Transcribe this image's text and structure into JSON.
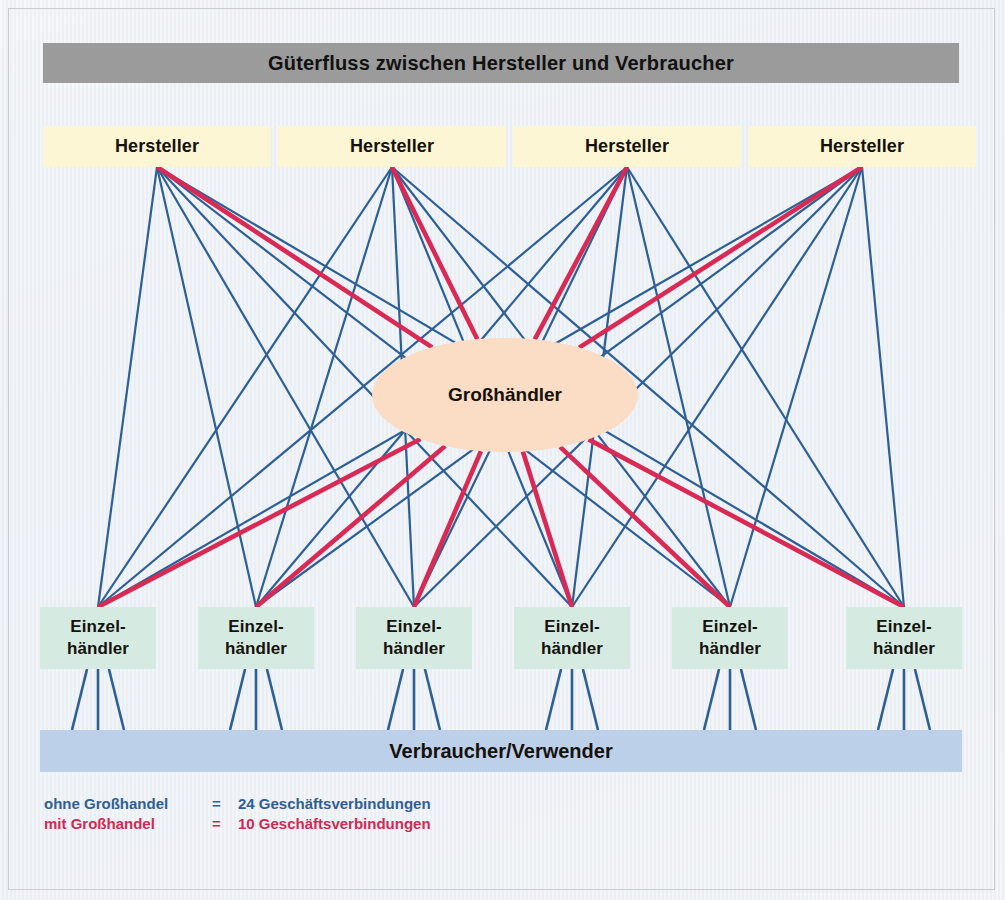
{
  "title": "Güterfluss zwischen Hersteller und Verbraucher",
  "nodes": {
    "producers": [
      {
        "label": "Hersteller"
      },
      {
        "label": "Hersteller"
      },
      {
        "label": "Hersteller"
      },
      {
        "label": "Hersteller"
      }
    ],
    "wholesaler": {
      "label": "Großhändler"
    },
    "retailers": [
      {
        "line1": "Einzel-",
        "line2": "händler"
      },
      {
        "line1": "Einzel-",
        "line2": "händler"
      },
      {
        "line1": "Einzel-",
        "line2": "händler"
      },
      {
        "line1": "Einzel-",
        "line2": "händler"
      },
      {
        "line1": "Einzel-",
        "line2": "händler"
      },
      {
        "line1": "Einzel-",
        "line2": "händler"
      }
    ],
    "consumers": {
      "label": "Verbraucher/Verwender"
    }
  },
  "legend": {
    "rows": [
      {
        "label": "ohne Großhandel",
        "eq": "=",
        "value": "24 Geschäftsverbindungen",
        "color": "#2e5f93"
      },
      {
        "label": "mit Großhandel",
        "eq": "=",
        "value": "10 Geschäftsverbindungen",
        "color": "#cf2a52"
      }
    ]
  },
  "colors": {
    "title_bar": "#9b9b9b",
    "producer_box": "#fdf6d4",
    "wholesaler_ellipse": "#fbdcc4",
    "retailer_box": "#d5ebe2",
    "consumer_bar": "#bdd0ea",
    "direct_line": "#2e5f93",
    "wholesale_line": "#d92a55",
    "background": "#eef1f5"
  },
  "chart_data": {
    "type": "diagram",
    "title": "Güterfluss zwischen Hersteller und Verbraucher",
    "counts": {
      "producers": 4,
      "wholesalers": 1,
      "retailers": 6,
      "direct_connections": 24,
      "wholesale_connections": 10
    },
    "edges": {
      "direct_producer_to_retailer": 24,
      "producer_to_wholesaler": 4,
      "wholesaler_to_retailer": 6,
      "retailer_to_consumer_ticks": 18
    }
  }
}
